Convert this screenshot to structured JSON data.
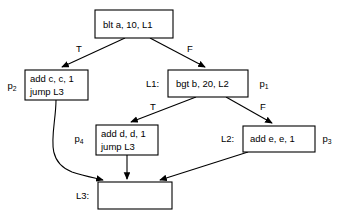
{
  "diagram": {
    "background_color": "#ffffff",
    "stroke_color": "#000000",
    "nodes": [
      {
        "id": "entry",
        "label": "blt a, 10, L1",
        "lines": [
          "blt a, 10, L1"
        ],
        "tag": "",
        "path_label": "",
        "x": 95,
        "y": 10,
        "w": 78,
        "h": 28
      },
      {
        "id": "addc",
        "label": "add c, c, 1 / jump L3",
        "lines": [
          "add c, c, 1",
          "jump L3"
        ],
        "tag": "",
        "path_label": "p",
        "path_sub": "2",
        "x": 25,
        "y": 70,
        "w": 63,
        "h": 30
      },
      {
        "id": "bgt",
        "label": "bgt b, 20, L2",
        "lines": [
          "bgt b, 20, L2"
        ],
        "tag": "L1:",
        "path_label": "p",
        "path_sub": "1",
        "x": 168,
        "y": 70,
        "w": 80,
        "h": 27
      },
      {
        "id": "addd",
        "label": "add d, d, 1 / jump L3",
        "lines": [
          "add d, d, 1",
          "jump L3"
        ],
        "tag": "",
        "path_label": "p",
        "path_sub": "4",
        "x": 96,
        "y": 125,
        "w": 62,
        "h": 30
      },
      {
        "id": "adde",
        "label": "add e, e, 1",
        "lines": [
          "add e, e, 1"
        ],
        "tag": "L2:",
        "path_label": "p",
        "path_sub": "3",
        "x": 243,
        "y": 126,
        "w": 72,
        "h": 26
      },
      {
        "id": "l3",
        "label": "",
        "lines": [],
        "tag": "L3:",
        "path_label": "",
        "x": 98,
        "y": 182,
        "w": 74,
        "h": 27
      }
    ],
    "edge_labels": {
      "entry_true": "T",
      "entry_false": "F",
      "bgt_true": "T",
      "bgt_false": "F"
    },
    "block_tags": {
      "l1": "L1:",
      "l2": "L2:",
      "l3": "L3:"
    },
    "path_labels": {
      "p1": "p",
      "p1_sub": "1",
      "p2": "p",
      "p2_sub": "2",
      "p3": "p",
      "p3_sub": "3",
      "p4": "p",
      "p4_sub": "4"
    }
  }
}
